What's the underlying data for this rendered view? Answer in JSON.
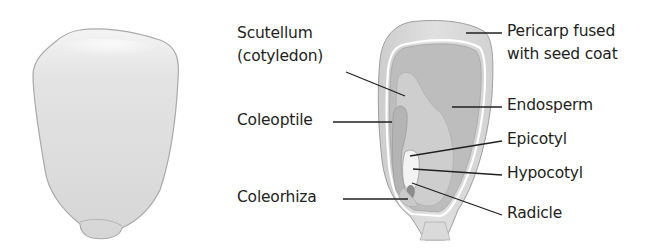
{
  "diagram": {
    "left_figure": {
      "name": "whole-kernel",
      "description": "External view of corn kernel"
    },
    "right_figure": {
      "name": "kernel-section",
      "description": "Longitudinal section of corn kernel"
    },
    "labels": {
      "scutellum_line1": "Scutellum",
      "scutellum_line2": "(cotyledon)",
      "coleoptile": "Coleoptile",
      "coleorhiza": "Coleorhiza",
      "pericarp_line1": "Pericarp fused",
      "pericarp_line2": "with seed coat",
      "endosperm": "Endosperm",
      "epicotyl": "Epicotyl",
      "hypocotyl": "Hypocotyl",
      "radicle": "Radicle"
    },
    "colors": {
      "text": "#231f20",
      "leader_line": "#231f20",
      "kernel_outer": "#d9d9d9",
      "kernel_outline": "#a8a8a8",
      "pericarp": "#dcdcdc",
      "endosperm": "#bdbdbd",
      "scutellum": "#cfcfcf",
      "embryo_axis": "#f2f2f2"
    }
  }
}
